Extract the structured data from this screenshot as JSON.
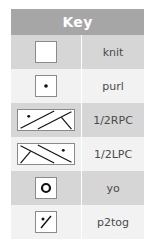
{
  "key": {
    "title": "Key",
    "rows": [
      {
        "symbol": "knit-symbol",
        "label": "knit"
      },
      {
        "symbol": "purl-symbol",
        "label": "purl"
      },
      {
        "symbol": "right-purl-cross-symbol",
        "label": "1/2RPC"
      },
      {
        "symbol": "left-purl-cross-symbol",
        "label": "1/2LPC"
      },
      {
        "symbol": "yarn-over-symbol",
        "label": "yo"
      },
      {
        "symbol": "p2tog-symbol",
        "label": "p2tog"
      }
    ]
  },
  "colors": {
    "header_bg": "#a6a6a6",
    "row_dark": "#d6d6d6",
    "row_light": "#f2f2f2",
    "text": "#4a4a4a",
    "symbol_stroke": "#111111"
  }
}
